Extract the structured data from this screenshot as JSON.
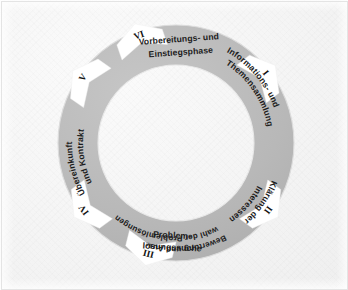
{
  "diagram": {
    "type": "circular-process-wheel",
    "center": {
      "x": 176,
      "y": 143
    },
    "outer_radius": 118,
    "inner_radius": 78,
    "colors": {
      "background": "#f4f4f4",
      "ring": "#b4b4b4",
      "ring_light": "#c2c2c2",
      "ring_dark": "#a6a6a6",
      "notch": "#ffffff",
      "text": "#1c1c1c",
      "border": "#e4e4e4"
    },
    "segments": [
      {
        "numeral": "I",
        "name": "vorbereitung",
        "lines": [
          "Vorbereitungs- und",
          "Einstiegsphase"
        ],
        "text": "Vorbereitungs- und Einstiegsphase",
        "orientation": "horizontal"
      },
      {
        "numeral": "II",
        "name": "informationssammlung",
        "lines": [
          "Informations- und",
          "Themensammlung"
        ],
        "text": "Informations- und Themensammlung",
        "orientation": "rotated"
      },
      {
        "numeral": "III",
        "name": "klaerung-interessen",
        "lines": [
          "Klärung der",
          "Interessen"
        ],
        "text": "Klärung der Interessen",
        "orientation": "rotated"
      },
      {
        "numeral": "IV",
        "name": "problemloesungssuche",
        "lines": [
          "Problem-",
          "lösungssuche"
        ],
        "text": "Problem-lösungssuche",
        "orientation": "horizontal"
      },
      {
        "numeral": "V",
        "name": "bewertung-auswahl",
        "lines": [
          "Bewertung und Aus-",
          "wahl der Problemlösungen"
        ],
        "text": "Bewertung und Auswahl der Problemlösungen",
        "orientation": "rotated"
      },
      {
        "numeral": "VI",
        "name": "uebereinkunft-kontrakt",
        "lines": [
          "Übereinkunft",
          "und Kontrakt"
        ],
        "text": "Übereinkunft und Kontrakt",
        "orientation": "rotated"
      }
    ]
  }
}
